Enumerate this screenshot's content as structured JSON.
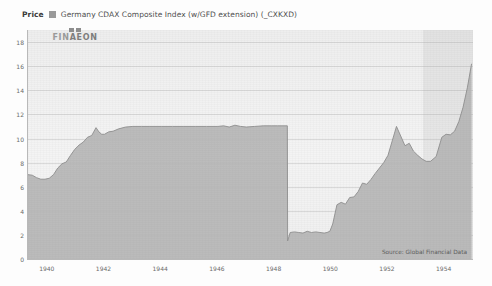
{
  "header": {
    "price_label": "Price",
    "legend_swatch_color": "#9a9a9a",
    "series_title": "Germany CDAX Composite Index (w/GFD extension) (_CXKXD)"
  },
  "logo": {
    "word_part1": "FIN",
    "word_part2": "AEON",
    "full": "FINAEON"
  },
  "source_note": "Source: Global Financial Data",
  "chart_data": {
    "type": "area",
    "title": "Germany CDAX Composite Index (w/GFD extension) (_CXKXD)",
    "xlabel": "",
    "ylabel": "Price",
    "legend": [
      "Germany CDAX Composite Index (w/GFD extension) (_CXKXD)"
    ],
    "legend_position": "top-left",
    "grid": true,
    "xlim": [
      1939.3,
      1955.0
    ],
    "ylim": [
      0,
      19
    ],
    "yticks": [
      0,
      2,
      4,
      6,
      8,
      10,
      12,
      14,
      16,
      18
    ],
    "ytick_labels": [
      "0",
      "2",
      "4",
      "6",
      "8",
      "10",
      "12",
      "14",
      "16",
      "18"
    ],
    "xticks": [
      1940,
      1942,
      1944,
      1946,
      1948,
      1950,
      1952,
      1954
    ],
    "xtick_labels": [
      "1940",
      "1942",
      "1944",
      "1946",
      "1948",
      "1950",
      "1952",
      "1954"
    ],
    "area_fill_color": "#b6b6b6",
    "line_color": "#8f8f8f",
    "plot_background": "#f0f0f0",
    "shaded_band": {
      "from": 1953.25,
      "to": 1955.0,
      "color": "rgba(150,150,150,0.13)"
    },
    "annotations": [
      {
        "text": "Source: Global Financial Data",
        "position": "bottom-right"
      }
    ],
    "series": [
      {
        "name": "Germany CDAX Composite Index (w/GFD extension) (_CXKXD)",
        "x": [
          1939.3,
          1939.45,
          1939.6,
          1939.75,
          1939.9,
          1940.05,
          1940.2,
          1940.35,
          1940.5,
          1940.65,
          1940.8,
          1940.95,
          1941.1,
          1941.25,
          1941.4,
          1941.55,
          1941.7,
          1941.8,
          1941.9,
          1942.0,
          1942.15,
          1942.3,
          1942.5,
          1942.75,
          1943.0,
          1943.3,
          1943.6,
          1944.0,
          1944.4,
          1944.8,
          1945.2,
          1945.6,
          1946.0,
          1946.2,
          1946.4,
          1946.6,
          1946.8,
          1947.0,
          1947.3,
          1947.6,
          1947.9,
          1948.1,
          1948.3,
          1948.45,
          1948.46,
          1948.55,
          1948.7,
          1948.85,
          1949.0,
          1949.15,
          1949.3,
          1949.45,
          1949.6,
          1949.75,
          1949.85,
          1949.95,
          1950.05,
          1950.2,
          1950.35,
          1950.5,
          1950.65,
          1950.8,
          1950.95,
          1951.1,
          1951.25,
          1951.4,
          1951.55,
          1951.7,
          1951.85,
          1952.0,
          1952.15,
          1952.3,
          1952.45,
          1952.6,
          1952.75,
          1952.9,
          1953.05,
          1953.2,
          1953.35,
          1953.5,
          1953.7,
          1953.9,
          1954.05,
          1954.2,
          1954.35,
          1954.5,
          1954.65,
          1954.8,
          1954.95
        ],
        "y": [
          7.0,
          6.95,
          6.75,
          6.62,
          6.62,
          6.7,
          7.0,
          7.55,
          7.9,
          8.05,
          8.6,
          9.1,
          9.45,
          9.7,
          10.1,
          10.25,
          10.9,
          10.55,
          10.35,
          10.35,
          10.55,
          10.6,
          10.8,
          10.95,
          11.0,
          11.0,
          11.0,
          11.0,
          11.0,
          11.0,
          11.0,
          11.0,
          11.0,
          11.05,
          10.95,
          11.1,
          11.0,
          10.95,
          11.0,
          11.05,
          11.05,
          11.05,
          11.05,
          11.05,
          1.5,
          2.2,
          2.25,
          2.2,
          2.15,
          2.3,
          2.2,
          2.25,
          2.2,
          2.15,
          2.2,
          2.3,
          2.9,
          4.5,
          4.7,
          4.55,
          5.1,
          5.15,
          5.6,
          6.3,
          6.2,
          6.6,
          7.1,
          7.55,
          8.0,
          8.6,
          9.8,
          11.0,
          10.2,
          9.4,
          9.6,
          8.95,
          8.6,
          8.3,
          8.1,
          8.1,
          8.5,
          10.1,
          10.35,
          10.3,
          10.6,
          11.4,
          12.6,
          14.2,
          16.2
        ]
      }
    ]
  }
}
